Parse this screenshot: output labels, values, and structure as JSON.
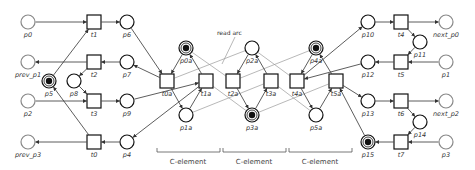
{
  "diagram": {
    "type": "petri-net",
    "annotation": "read arc",
    "c_elements": [
      "C-element",
      "C-element",
      "C-element"
    ],
    "places": [
      {
        "id": "p0",
        "label": "p0",
        "x": 28,
        "y": 22,
        "marked": false,
        "interface": true
      },
      {
        "id": "prev_p1",
        "label": "prev_p1",
        "x": 28,
        "y": 62,
        "marked": false,
        "interface": true
      },
      {
        "id": "p2",
        "label": "p2",
        "x": 28,
        "y": 101,
        "marked": false,
        "interface": true
      },
      {
        "id": "prev_p3",
        "label": "prev_p3",
        "x": 28,
        "y": 142,
        "marked": false,
        "interface": true
      },
      {
        "id": "p5",
        "label": "p5",
        "x": 49,
        "y": 81,
        "marked": true
      },
      {
        "id": "p8",
        "label": "p8",
        "x": 74,
        "y": 81,
        "marked": false
      },
      {
        "id": "p6",
        "label": "p6",
        "x": 127,
        "y": 22,
        "marked": false
      },
      {
        "id": "p7",
        "label": "p7",
        "x": 127,
        "y": 62,
        "marked": false
      },
      {
        "id": "p9",
        "label": "p9",
        "x": 127,
        "y": 101,
        "marked": false
      },
      {
        "id": "p4",
        "label": "p4",
        "x": 127,
        "y": 142,
        "marked": false
      },
      {
        "id": "p0a",
        "label": "p0a",
        "x": 186,
        "y": 48,
        "marked": true
      },
      {
        "id": "p1a",
        "label": "p1a",
        "x": 186,
        "y": 115,
        "marked": false
      },
      {
        "id": "p2a",
        "label": "p2a",
        "x": 252,
        "y": 48,
        "marked": false
      },
      {
        "id": "p3a",
        "label": "p3a",
        "x": 252,
        "y": 115,
        "marked": true
      },
      {
        "id": "p4a",
        "label": "p4a",
        "x": 316,
        "y": 48,
        "marked": true
      },
      {
        "id": "p5a",
        "label": "p5a",
        "x": 316,
        "y": 115,
        "marked": false
      },
      {
        "id": "p10",
        "label": "p10",
        "x": 368,
        "y": 22,
        "marked": false
      },
      {
        "id": "p12",
        "label": "p12",
        "x": 368,
        "y": 62,
        "marked": false
      },
      {
        "id": "p13",
        "label": "p13",
        "x": 368,
        "y": 101,
        "marked": false
      },
      {
        "id": "p15",
        "label": "p15",
        "x": 368,
        "y": 142,
        "marked": true
      },
      {
        "id": "p11",
        "label": "p11",
        "x": 420,
        "y": 42,
        "marked": false
      },
      {
        "id": "p14",
        "label": "p14",
        "x": 420,
        "y": 122,
        "marked": false
      },
      {
        "id": "next_p0",
        "label": "next_p0",
        "x": 446,
        "y": 22,
        "marked": false,
        "interface": true
      },
      {
        "id": "p1",
        "label": "p1",
        "x": 446,
        "y": 62,
        "marked": false,
        "interface": true
      },
      {
        "id": "next_p2",
        "label": "next_p2",
        "x": 446,
        "y": 101,
        "marked": false,
        "interface": true
      },
      {
        "id": "p3",
        "label": "p3",
        "x": 446,
        "y": 142,
        "marked": false,
        "interface": true
      }
    ],
    "transitions": [
      {
        "id": "t1",
        "label": "t1",
        "x": 94,
        "y": 22
      },
      {
        "id": "t2",
        "label": "t2",
        "x": 94,
        "y": 62
      },
      {
        "id": "t3",
        "label": "t3",
        "x": 94,
        "y": 101
      },
      {
        "id": "t0",
        "label": "t0",
        "x": 94,
        "y": 142
      },
      {
        "id": "t0a",
        "label": "t0a",
        "x": 167,
        "y": 81
      },
      {
        "id": "t1a",
        "label": "t1a",
        "x": 206,
        "y": 81
      },
      {
        "id": "t2a",
        "label": "t2a",
        "x": 233,
        "y": 81
      },
      {
        "id": "t3a",
        "label": "t3a",
        "x": 271,
        "y": 81
      },
      {
        "id": "t4a",
        "label": "t4a",
        "x": 297,
        "y": 81
      },
      {
        "id": "t5a",
        "label": "t5a",
        "x": 336,
        "y": 81
      },
      {
        "id": "t4",
        "label": "t4",
        "x": 401,
        "y": 22
      },
      {
        "id": "t5",
        "label": "t5",
        "x": 401,
        "y": 62
      },
      {
        "id": "t6",
        "label": "t6",
        "x": 401,
        "y": 101
      },
      {
        "id": "t7",
        "label": "t7",
        "x": 401,
        "y": 142
      }
    ],
    "arcs": [
      {
        "from": "p0",
        "to": "t1"
      },
      {
        "from": "t1",
        "to": "p6"
      },
      {
        "from": "p7",
        "to": "t2"
      },
      {
        "from": "t2",
        "to": "prev_p1"
      },
      {
        "from": "p2",
        "to": "t3"
      },
      {
        "from": "t3",
        "to": "p9"
      },
      {
        "from": "p4",
        "to": "t0"
      },
      {
        "from": "t0",
        "to": "prev_p3"
      },
      {
        "from": "p5",
        "to": "t1"
      },
      {
        "from": "t0",
        "to": "p5"
      },
      {
        "from": "t2",
        "to": "p8"
      },
      {
        "from": "p8",
        "to": "t3"
      },
      {
        "from": "p6",
        "to": "t0a"
      },
      {
        "from": "t0a",
        "to": "p7"
      },
      {
        "from": "p9",
        "to": "t1a"
      },
      {
        "from": "t1a",
        "to": "p4"
      },
      {
        "from": "p0a",
        "to": "t0a"
      },
      {
        "from": "t0a",
        "to": "p1a"
      },
      {
        "from": "p1a",
        "to": "t1a"
      },
      {
        "from": "t1a",
        "to": "p0a"
      },
      {
        "from": "p2a",
        "to": "t2a"
      },
      {
        "from": "t2a",
        "to": "p3a"
      },
      {
        "from": "p3a",
        "to": "t3a"
      },
      {
        "from": "t3a",
        "to": "p2a"
      },
      {
        "from": "p4a",
        "to": "t4a"
      },
      {
        "from": "t4a",
        "to": "p5a"
      },
      {
        "from": "p5a",
        "to": "t5a"
      },
      {
        "from": "t5a",
        "to": "p4a"
      },
      {
        "from": "t4a",
        "to": "p10"
      },
      {
        "from": "p12",
        "to": "t4a"
      },
      {
        "from": "t5a",
        "to": "p13"
      },
      {
        "from": "p15",
        "to": "t5a"
      },
      {
        "from": "p10",
        "to": "t4"
      },
      {
        "from": "t4",
        "to": "next_p0"
      },
      {
        "from": "t4",
        "to": "p11"
      },
      {
        "from": "p11",
        "to": "t5"
      },
      {
        "from": "p1",
        "to": "t5"
      },
      {
        "from": "t5",
        "to": "p12"
      },
      {
        "from": "p13",
        "to": "t6"
      },
      {
        "from": "t6",
        "to": "next_p2"
      },
      {
        "from": "t6",
        "to": "p14"
      },
      {
        "from": "p14",
        "to": "t7"
      },
      {
        "from": "p3",
        "to": "t7"
      },
      {
        "from": "t7",
        "to": "p15"
      }
    ],
    "read_arcs": [
      {
        "place": "p0a",
        "transition": "t2a"
      },
      {
        "place": "p1a",
        "transition": "t3a"
      },
      {
        "place": "p2a",
        "transition": "t0a"
      },
      {
        "place": "p3a",
        "transition": "t1a"
      },
      {
        "place": "p2a",
        "transition": "t4a"
      },
      {
        "place": "p3a",
        "transition": "t5a"
      },
      {
        "place": "p4a",
        "transition": "t2a"
      },
      {
        "place": "p5a",
        "transition": "t3a"
      }
    ]
  }
}
